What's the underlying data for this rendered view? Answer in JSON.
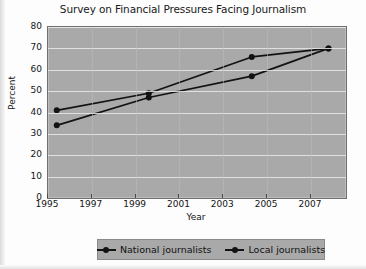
{
  "chart_data": {
    "type": "line",
    "title": "Survey on Financial Pressures Facing Journalism",
    "xlabel": "Year",
    "ylabel": "Percent",
    "xlim": [
      1995,
      2008.6
    ],
    "ylim": [
      0,
      80
    ],
    "xticks": [
      1995,
      1997,
      1999,
      2001,
      2003,
      2005,
      2007
    ],
    "xtick_labels": [
      "1995",
      "1997",
      "1999",
      "2001",
      "2003",
      "2005",
      "2007"
    ],
    "yticks": [
      0,
      10,
      20,
      30,
      40,
      50,
      60,
      70,
      80
    ],
    "ytick_labels": [
      "0",
      "10",
      "20",
      "30",
      "40",
      "50",
      "60",
      "70",
      "80"
    ],
    "grid": "horizontal",
    "legend_position": "bottom",
    "series": [
      {
        "name": "National journalists",
        "color": "#121212",
        "x": [
          1995.4,
          1999.6,
          2004.3,
          2007.8
        ],
        "values": [
          41,
          49,
          66,
          70
        ]
      },
      {
        "name": "Local journalists",
        "color": "#121212",
        "x": [
          1995.4,
          1999.6,
          2004.3,
          2007.8
        ],
        "values": [
          34,
          47,
          57,
          70
        ]
      }
    ]
  },
  "legend": {
    "entries": [
      {
        "label": "National journalists",
        "marker": "line-dot-marker"
      },
      {
        "label": "Local journalists",
        "marker": "line-dot-marker"
      }
    ]
  }
}
